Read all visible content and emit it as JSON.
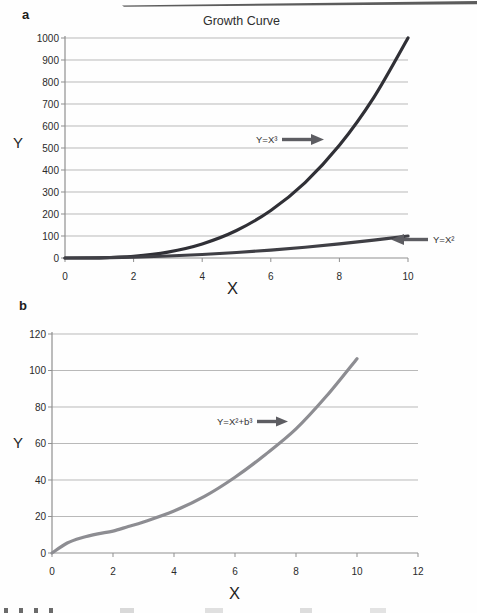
{
  "figure": {
    "scan_artifact": "page-edge-line-top"
  },
  "colors": {
    "grid": "#b9b9b9",
    "axis": "#8f8f8f",
    "tick_text": "#2a2a2a",
    "arrow": "#5d5d62",
    "curve_x3": "#303036",
    "curve_x2": "#3f3f45",
    "curve_b": "#8d8d92"
  },
  "chart_data": [
    {
      "id": "a",
      "type": "line",
      "panel_label": "a",
      "title": "Growth Curve",
      "xlabel": "X",
      "ylabel": "Y",
      "xlim": [
        0,
        10
      ],
      "ylim": [
        0,
        1000
      ],
      "xticks": [
        0,
        2,
        4,
        6,
        8,
        10
      ],
      "yticks": [
        0,
        100,
        200,
        300,
        400,
        500,
        600,
        700,
        800,
        900,
        1000
      ],
      "grid": "horizontal",
      "legend": "none",
      "series": [
        {
          "name": "Y=X³",
          "color_key": "curve_x3",
          "x": [
            0,
            1,
            2,
            3,
            4,
            5,
            6,
            7,
            8,
            9,
            10
          ],
          "values": [
            0,
            1,
            8,
            27,
            64,
            125,
            216,
            343,
            512,
            729,
            1000
          ]
        },
        {
          "name": "Y=X²",
          "color_key": "curve_x2",
          "x": [
            0,
            1,
            2,
            3,
            4,
            5,
            6,
            7,
            8,
            9,
            10
          ],
          "values": [
            0,
            1,
            4,
            9,
            16,
            25,
            36,
            49,
            64,
            81,
            100
          ]
        }
      ],
      "annotations": [
        {
          "text": "Y=X³",
          "arrow": "right",
          "points_to": "Y=X³ curve near Y=540"
        },
        {
          "text": "Y=X²",
          "arrow": "left",
          "points_to": "Y=X² curve end near (10,100)"
        }
      ]
    },
    {
      "id": "b",
      "type": "line",
      "panel_label": "b",
      "title": "",
      "xlabel": "X",
      "ylabel": "Y",
      "xlim": [
        0,
        12
      ],
      "ylim": [
        0,
        120
      ],
      "xticks": [
        0,
        2,
        4,
        6,
        8,
        10,
        12
      ],
      "yticks": [
        0,
        20,
        40,
        60,
        80,
        100,
        120
      ],
      "grid": "horizontal",
      "legend": "none",
      "series": [
        {
          "name": "Y=X²+b³",
          "color_key": "curve_b",
          "x": [
            0,
            0.5,
            1,
            1.5,
            2,
            2.5,
            3,
            4,
            5,
            6,
            7,
            8,
            9,
            10
          ],
          "values": [
            0,
            5.5,
            8.5,
            10.5,
            12,
            14.5,
            17,
            23,
            31,
            41.5,
            54,
            68,
            86,
            106.5
          ]
        }
      ],
      "annotations": [
        {
          "text": "Y=X²+b³",
          "arrow": "right",
          "points_to": "curve near Y=70"
        }
      ]
    }
  ]
}
